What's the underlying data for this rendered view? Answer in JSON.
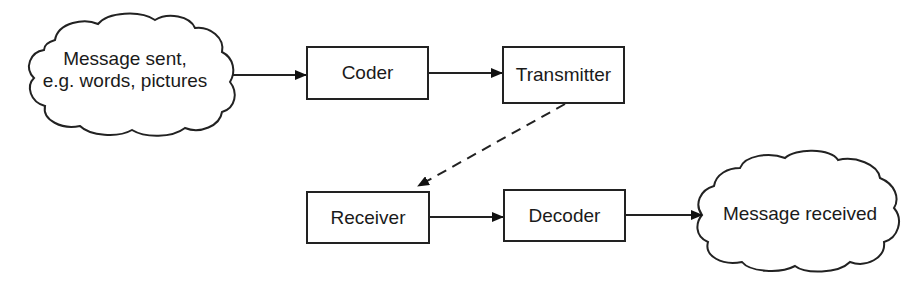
{
  "diagram": {
    "nodes": {
      "message_sent": {
        "line1": "Message sent,",
        "line2": "e.g. words, pictures",
        "shape": "cloud"
      },
      "coder": {
        "label": "Coder",
        "shape": "box"
      },
      "transmitter": {
        "label": "Transmitter",
        "shape": "box"
      },
      "receiver": {
        "label": "Receiver",
        "shape": "box"
      },
      "decoder": {
        "label": "Decoder",
        "shape": "box"
      },
      "message_received": {
        "label": "Message received",
        "shape": "cloud"
      }
    },
    "edges": [
      {
        "from": "message_sent",
        "to": "coder",
        "style": "solid"
      },
      {
        "from": "coder",
        "to": "transmitter",
        "style": "solid"
      },
      {
        "from": "transmitter",
        "to": "receiver",
        "style": "dashed"
      },
      {
        "from": "receiver",
        "to": "decoder",
        "style": "solid"
      },
      {
        "from": "decoder",
        "to": "message_received",
        "style": "solid"
      }
    ],
    "colors": {
      "stroke": "#222222",
      "background": "#ffffff",
      "text": "#1a1a1a"
    }
  }
}
